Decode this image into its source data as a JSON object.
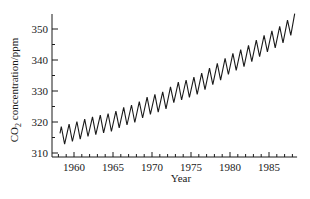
{
  "chart_data": {
    "type": "line",
    "title": "",
    "xlabel": "Year",
    "ylabel": "CO2 concentration/ppm",
    "ylabel_parts": {
      "main": "CO",
      "sub": "2",
      "rest": " concentration/ppm"
    },
    "xlim": [
      1957.5,
      1988.5
    ],
    "ylim": [
      308.5,
      355
    ],
    "x_ticks": [
      1960,
      1965,
      1970,
      1975,
      1980,
      1985
    ],
    "x_tick_labels": [
      "1960",
      "1965",
      "1970",
      "1975",
      "1980",
      "1985"
    ],
    "y_ticks": [
      310,
      320,
      330,
      340,
      350
    ],
    "y_tick_labels": [
      "310",
      "320",
      "330",
      "340",
      "350"
    ],
    "grid": false,
    "legend": null,
    "seasonal_amplitude_ppm": 6,
    "series": [
      {
        "name": "CO2 annual mean (seasonal oscillation superimposed)",
        "x": [
          1958,
          1959,
          1960,
          1961,
          1962,
          1963,
          1964,
          1965,
          1966,
          1967,
          1968,
          1969,
          1970,
          1971,
          1972,
          1973,
          1974,
          1975,
          1976,
          1977,
          1978,
          1979,
          1980,
          1981,
          1982,
          1983,
          1984,
          1985,
          1986,
          1987,
          1988
        ],
        "values": [
          315.3,
          316.0,
          316.9,
          317.6,
          318.5,
          319.0,
          319.6,
          320.0,
          321.4,
          322.2,
          323.0,
          324.6,
          325.7,
          326.3,
          327.5,
          329.7,
          330.2,
          331.1,
          332.1,
          333.8,
          335.4,
          336.8,
          338.7,
          339.9,
          341.1,
          342.8,
          344.4,
          345.9,
          347.2,
          348.9,
          351.5
        ]
      }
    ]
  }
}
